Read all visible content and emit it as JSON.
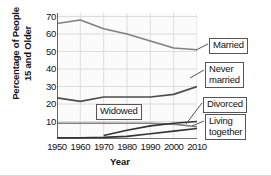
{
  "chart_data": {
    "type": "line",
    "title": "",
    "xlabel": "Year",
    "ylabel": "Percentage of People\n15 and Older",
    "ylabel_line1": "Percentage of People",
    "ylabel_line2": "15 and Older",
    "x": [
      1950,
      1960,
      1970,
      1980,
      1990,
      2000,
      2010
    ],
    "xticklabels": [
      "1950",
      "1960",
      "1970",
      "1980",
      "1990",
      "2000",
      "2010"
    ],
    "yticklabels": [
      "10",
      "20",
      "30",
      "40",
      "50",
      "60",
      "70"
    ],
    "yticks": [
      10,
      20,
      30,
      40,
      50,
      60,
      70
    ],
    "xlim": [
      1950,
      2010
    ],
    "ylim": [
      0,
      72
    ],
    "grid": true,
    "legend_position": "callout-labels-right",
    "series": [
      {
        "name": "Married",
        "label": "Married",
        "color": "#808080",
        "x": [
          1950,
          1960,
          1970,
          1980,
          1990,
          2000,
          2010
        ],
        "values": [
          66,
          68,
          63,
          60,
          56,
          52,
          51
        ]
      },
      {
        "name": "Never married",
        "label": "Never\nmarried",
        "color": "#4d4d4d",
        "x": [
          1950,
          1960,
          1970,
          1980,
          1990,
          2000,
          2010
        ],
        "values": [
          23.5,
          21.5,
          24,
          24,
          24,
          25.5,
          30
        ]
      },
      {
        "name": "Widowed",
        "label": "Widowed",
        "color": "#808080",
        "x": [
          1950,
          1960,
          1970,
          1980,
          1990,
          2000,
          2010
        ],
        "values": [
          9,
          9,
          9,
          9,
          9,
          8.5,
          7
        ]
      },
      {
        "name": "Divorced",
        "label": "Divorced",
        "color": "#333333",
        "x": [
          1970,
          1980,
          1990,
          2000,
          2010
        ],
        "values": [
          2,
          5,
          7.5,
          9,
          10
        ]
      },
      {
        "name": "Living together",
        "label": "Living\ntogether",
        "color": "#333333",
        "x": [
          1950,
          1960,
          1970,
          1980,
          1990,
          2000,
          2010
        ],
        "values": [
          0.6,
          0.7,
          0.9,
          1.5,
          3,
          4.5,
          6
        ]
      }
    ]
  }
}
